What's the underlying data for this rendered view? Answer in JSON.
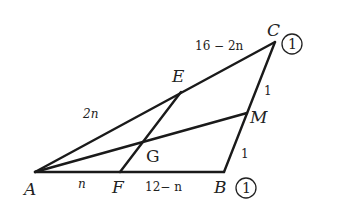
{
  "diagram": {
    "points": {
      "A": {
        "label": "A",
        "x": 35,
        "y": 172
      },
      "F": {
        "label": "F",
        "x": 120,
        "y": 172
      },
      "B": {
        "label": "B",
        "x": 224,
        "y": 172
      },
      "C": {
        "label": "C",
        "x": 275,
        "y": 42
      },
      "M": {
        "label": "M",
        "x": 247,
        "y": 113
      },
      "E": {
        "label": "E",
        "x": 181,
        "y": 92
      },
      "G": {
        "label": "G",
        "x": 143,
        "y": 143
      }
    },
    "segments": [
      {
        "from": "A",
        "to": "B"
      },
      {
        "from": "B",
        "to": "C"
      },
      {
        "from": "A",
        "to": "C"
      },
      {
        "from": "A",
        "to": "M"
      },
      {
        "from": "E",
        "to": "F"
      }
    ],
    "length_labels": {
      "AE": "2n",
      "EC": "16 − 2n",
      "AF": "n",
      "FB": "12− n",
      "CM": "1",
      "MB": "1"
    },
    "mass_labels": {
      "C": "1",
      "B": "1"
    },
    "colors": {
      "stroke": "#1a1a1a",
      "text": "#222222",
      "background": "#ffffff"
    }
  }
}
